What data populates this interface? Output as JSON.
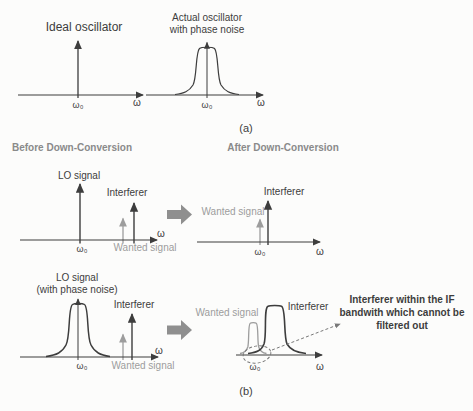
{
  "colors": {
    "ink": "#3d3d3d",
    "gray": "#9d9d9d",
    "header_gray": "#8a8a8a",
    "arrow_gray": "#8f8f8f",
    "background": "#fcfcfb"
  },
  "captions": {
    "a": "(a)",
    "b": "(b)"
  },
  "axis": {
    "omega_zero": "ω₀",
    "omega": "ω"
  },
  "panel_ideal": {
    "title": "Ideal oscillator"
  },
  "panel_actual": {
    "title_line1": "Actual oscillator",
    "title_line2": "with phase noise"
  },
  "headers": {
    "before": "Before Down-Conversion",
    "after": "After Down-Conversion"
  },
  "labels": {
    "lo_signal": "LO signal",
    "lo_phase_noise": "(with phase noise)",
    "interferer": "Interferer",
    "wanted_signal": "Wanted signal"
  },
  "annotation": {
    "line1": "Interferer within the IF",
    "line2": "bandwith which cannot be",
    "line3": "filtered out"
  }
}
